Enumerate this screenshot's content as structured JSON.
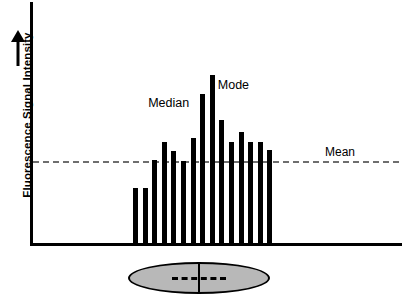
{
  "chart_data": {
    "type": "bar",
    "title": "",
    "xlabel": "",
    "ylabel": "Fluorescence Signal Intensity",
    "grid": false,
    "axis_arrow": "up-arrow-icon",
    "categories": [
      "1",
      "2",
      "3",
      "4",
      "5",
      "6",
      "7",
      "8",
      "9",
      "10",
      "11",
      "12",
      "13",
      "14",
      "15"
    ],
    "values": [
      34,
      34,
      51,
      62,
      56,
      50,
      64,
      91,
      102,
      75,
      62,
      68,
      62,
      62,
      57
    ],
    "ylim": [
      0,
      115
    ],
    "bar_color": "#000000",
    "bar_width_px": 5,
    "annotations": [
      {
        "name": "median",
        "label": "Median",
        "x_index": 7,
        "value": 91
      },
      {
        "name": "mode",
        "label": "Mode",
        "x_index": 8,
        "value": 102
      },
      {
        "name": "mean",
        "label": "Mean",
        "value": 50,
        "style": "dashed-line",
        "color": "#6e6e6e"
      }
    ],
    "reference_lines": [
      {
        "name": "mean-line",
        "label": "Mean",
        "y_value": 50,
        "dash": true,
        "color": "#6e6e6e"
      }
    ],
    "legend": {
      "position": "inline-annotations",
      "entries": [
        "Median",
        "Mode",
        "Mean"
      ]
    }
  },
  "axes": {
    "y_axis_label": "Fluorescence Signal Intensity",
    "y_axis_arrow_name": "up-arrow-icon",
    "x_axis_label": ""
  },
  "labels": {
    "median": "Median",
    "mode": "Mode",
    "mean": "Mean"
  },
  "diagram": {
    "cell_name": "cell-ellipse",
    "cell_fill_color": "#b8b8b8",
    "cell_outline_color": "#000000",
    "nucleus_marker": "dashed-cross-marker"
  },
  "colors": {
    "bar": "#000000",
    "mean_line": "#6e6e6e",
    "axis": "#000000",
    "cell_fill": "#b8b8b8",
    "background": "#ffffff"
  }
}
